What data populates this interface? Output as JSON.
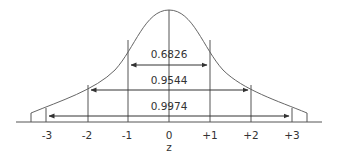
{
  "diagram": {
    "axis_label": "z",
    "ticks": [
      "-3",
      "-2",
      "-1",
      "0",
      "+1",
      "+2",
      "+3"
    ],
    "intervals": [
      {
        "range": "-1 to +1",
        "area": "0.6826"
      },
      {
        "range": "-2 to +2",
        "area": "0.9544"
      },
      {
        "range": "-3 to +3",
        "area": "0.9974"
      }
    ],
    "colors": {
      "line": "#555555",
      "text": "#333333"
    }
  }
}
